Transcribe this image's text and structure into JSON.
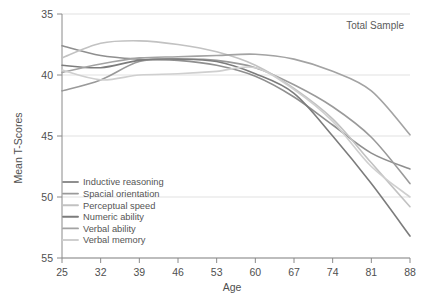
{
  "annotation": {
    "text": "Total Sample"
  },
  "axes": {
    "ylabel": "Mean T-Scores",
    "xlabel": "Age",
    "yticks": [
      "55",
      "50",
      "45",
      "40",
      "35"
    ],
    "xticks": [
      "25",
      "32",
      "39",
      "46",
      "53",
      "60",
      "67",
      "74",
      "81",
      "88"
    ]
  },
  "legend": {
    "items": [
      {
        "label": "Inductive reasoning",
        "color": "#8f8f8f"
      },
      {
        "label": "Spacial orientation",
        "color": "#9a9a9a"
      },
      {
        "label": "Perceptual speed",
        "color": "#c2c2c2"
      },
      {
        "label": "Numeric ability",
        "color": "#7c7c7c"
      },
      {
        "label": "Verbal ability",
        "color": "#a3a3a3"
      },
      {
        "label": "Verbal memory",
        "color": "#cfcfcf"
      }
    ]
  },
  "chart_data": {
    "type": "line",
    "title": "",
    "subtitle": "Total Sample",
    "xlabel": "Age",
    "ylabel": "Mean T-Scores",
    "xlim": [
      25,
      88
    ],
    "ylim": [
      35,
      55
    ],
    "xtick_values": [
      25,
      32,
      39,
      46,
      53,
      60,
      67,
      74,
      81,
      88
    ],
    "ytick_values": [
      35,
      40,
      45,
      50,
      55
    ],
    "grid": "horizontal",
    "legend_position": "lower-left-inside",
    "x": [
      25,
      32,
      39,
      46,
      53,
      60,
      67,
      74,
      81,
      88
    ],
    "series": [
      {
        "name": "Inductive reasoning",
        "color": "#8f8f8f",
        "values": [
          52.4,
          51.6,
          51.3,
          51.2,
          50.8,
          49.9,
          48.2,
          45.9,
          43.6,
          42.3
        ]
      },
      {
        "name": "Spacial orientation",
        "color": "#9a9a9a",
        "values": [
          48.7,
          49.6,
          51.1,
          51.3,
          51.2,
          50.6,
          49.2,
          47.4,
          44.9,
          41.1
        ]
      },
      {
        "name": "Perceptual speed",
        "color": "#c2c2c2",
        "values": [
          51.4,
          52.6,
          52.8,
          52.5,
          51.9,
          50.8,
          48.9,
          46.4,
          42.8,
          39.2
        ]
      },
      {
        "name": "Numeric ability",
        "color": "#7c7c7c",
        "values": [
          50.8,
          50.6,
          51.2,
          51.3,
          51.1,
          50.1,
          48.5,
          45.0,
          41.1,
          36.8
        ]
      },
      {
        "name": "Verbal ability",
        "color": "#a3a3a3",
        "values": [
          50.2,
          50.9,
          51.4,
          51.5,
          51.6,
          51.7,
          51.3,
          50.3,
          48.7,
          45.1
        ]
      },
      {
        "name": "Verbal memory",
        "color": "#cfcfcf",
        "values": [
          50.4,
          49.6,
          50.0,
          50.1,
          50.3,
          50.6,
          48.8,
          46.2,
          42.5,
          40.0
        ]
      }
    ]
  }
}
